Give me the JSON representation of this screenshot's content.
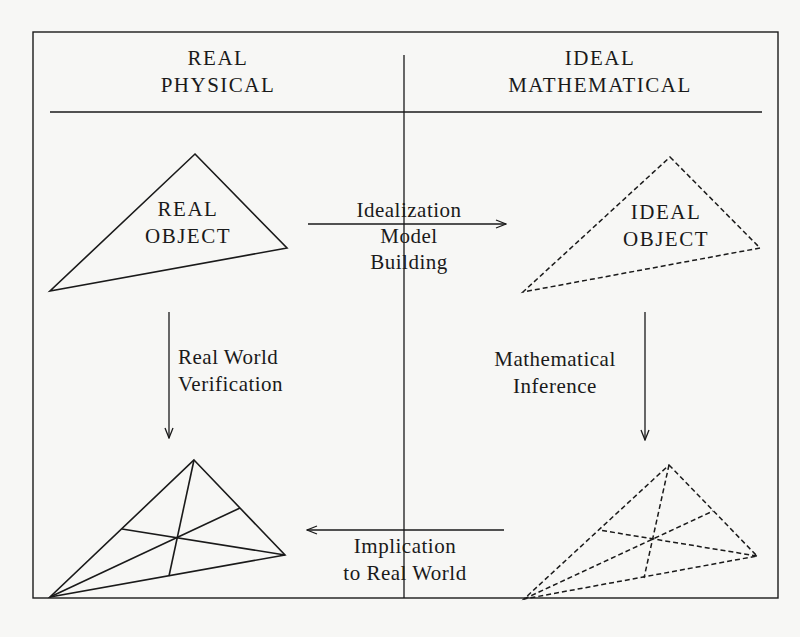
{
  "header": {
    "left": {
      "line1": "REAL",
      "line2": "PHYSICAL"
    },
    "right": {
      "line1": "IDEAL",
      "line2": "MATHEMATICAL"
    }
  },
  "nodes": {
    "real_object": {
      "line1": "REAL",
      "line2": "OBJECT",
      "style": "solid"
    },
    "ideal_object": {
      "line1": "IDEAL",
      "line2": "OBJECT",
      "style": "dashed"
    },
    "real_result": {
      "style": "solid-with-medians"
    },
    "ideal_result": {
      "style": "dashed-with-medians"
    }
  },
  "arrows": {
    "idealization": {
      "line1": "Idealization",
      "line2": "Model",
      "line3": "Building",
      "direction": "right"
    },
    "verification": {
      "line1": "Real World",
      "line2": "Verification",
      "direction": "up-from-bottom"
    },
    "inference": {
      "line1": "Mathematical",
      "line2": "Inference",
      "direction": "down"
    },
    "implication": {
      "line1": "Implication",
      "line2": "to Real World",
      "direction": "left"
    }
  },
  "colors": {
    "ink": "#1a1a1a",
    "paper": "#f7f7f5"
  }
}
